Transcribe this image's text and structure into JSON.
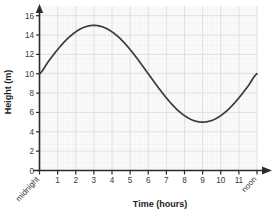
{
  "chart_data": {
    "type": "line",
    "title": "",
    "xlabel": "Time (hours)",
    "ylabel": "Height (m)",
    "xlim": [
      0,
      12
    ],
    "ylim": [
      0,
      17
    ],
    "grid": true,
    "legend": false,
    "x_tick_labels": [
      "midnight",
      "1",
      "2",
      "3",
      "4",
      "5",
      "6",
      "7",
      "8",
      "9",
      "10",
      "11",
      "noon"
    ],
    "x_tick_values": [
      0,
      1,
      2,
      3,
      4,
      5,
      6,
      7,
      8,
      9,
      10,
      11,
      12
    ],
    "y_tick_labels": [
      "0",
      "2",
      "4",
      "6",
      "8",
      "10",
      "12",
      "14",
      "16"
    ],
    "y_tick_values": [
      0,
      2,
      4,
      6,
      8,
      10,
      12,
      14,
      16
    ],
    "series": [
      {
        "name": "Tide height",
        "color": "#3b3b3b",
        "equation": "y = 10 + 5*sin(2*pi*x/12)",
        "x": [
          0,
          0.5,
          1,
          1.5,
          2,
          2.5,
          3,
          3.5,
          4,
          4.5,
          5,
          5.5,
          6,
          6.5,
          7,
          7.5,
          8,
          8.5,
          9,
          9.5,
          10,
          10.5,
          11,
          11.5,
          12
        ],
        "values": [
          10,
          11.29,
          12.5,
          13.54,
          14.33,
          14.83,
          15,
          14.83,
          14.33,
          13.54,
          12.5,
          11.29,
          10,
          8.71,
          7.5,
          6.46,
          5.67,
          5.17,
          5,
          5.17,
          5.67,
          6.46,
          7.5,
          8.71,
          10
        ]
      }
    ],
    "annotations": {
      "maximum": {
        "x": 3,
        "y": 15
      },
      "minimum": {
        "x": 9,
        "y": 5
      },
      "start": {
        "x": 0,
        "y": 10
      },
      "end": {
        "x": 12,
        "y": 10
      }
    },
    "colors": {
      "curve": "#3b3b3b",
      "axis": "#2b2b2b",
      "grid_minor": "#eceaea",
      "grid_major": "#dedada",
      "plot_background": "#fbfafa",
      "text": "#3a3a3a"
    }
  }
}
